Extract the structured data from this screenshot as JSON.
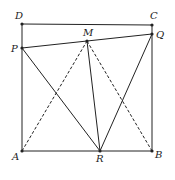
{
  "diagram": {
    "points": {
      "A": {
        "label": "A",
        "x": 22,
        "y": 151
      },
      "B": {
        "label": "B",
        "x": 152,
        "y": 151
      },
      "C": {
        "label": "C",
        "x": 152,
        "y": 25
      },
      "D": {
        "label": "D",
        "x": 22,
        "y": 24
      },
      "P": {
        "label": "P",
        "x": 22,
        "y": 48
      },
      "Q": {
        "label": "Q",
        "x": 152,
        "y": 34
      },
      "M": {
        "label": "M",
        "x": 87,
        "y": 41
      },
      "R": {
        "label": "R",
        "x": 100,
        "y": 151
      }
    },
    "solid_segments": [
      [
        "D",
        "C"
      ],
      [
        "C",
        "B"
      ],
      [
        "B",
        "A"
      ],
      [
        "A",
        "D"
      ],
      [
        "P",
        "Q"
      ],
      [
        "P",
        "R"
      ],
      [
        "M",
        "R"
      ],
      [
        "Q",
        "R"
      ]
    ],
    "dashed_segments": [
      [
        "A",
        "M"
      ],
      [
        "M",
        "B"
      ]
    ],
    "colors": {
      "stroke": "#222222",
      "background": "#ffffff"
    }
  }
}
